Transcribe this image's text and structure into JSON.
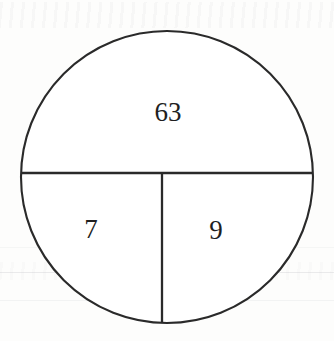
{
  "figure": {
    "kind": "divided-circle-diagram",
    "background_color": "#fdfdfc",
    "stroke_color": "#2a2a2a",
    "label_color": "#1f1f1f",
    "circle": {
      "center_x": 167,
      "center_y": 177,
      "radius": 146
    },
    "dividers": [
      {
        "name": "horizontal-diameter",
        "orientation": "horizontal",
        "y": 173,
        "x_start": 22,
        "x_end": 313
      },
      {
        "name": "vertical-radius",
        "orientation": "vertical",
        "x": 162,
        "y_start": 173,
        "y_end": 323
      }
    ],
    "regions": [
      {
        "name": "top-half",
        "label": "63",
        "label_x": 168,
        "label_y": 112
      },
      {
        "name": "bottom-left-quarter",
        "label": "7",
        "label_x": 91,
        "label_y": 229
      },
      {
        "name": "bottom-right-quarter",
        "label": "9",
        "label_x": 216,
        "label_y": 230
      }
    ]
  },
  "chart_data": {
    "type": "pie",
    "title": "",
    "subtitle": "",
    "xlabel": "",
    "ylabel": "",
    "legend_position": "none",
    "grid": false,
    "labels": [
      "63",
      "7",
      "9"
    ],
    "categories": [
      "top half",
      "bottom left quarter",
      "bottom right quarter"
    ],
    "values": [
      63,
      7,
      9
    ],
    "slice_fractions": [
      0.5,
      0.25,
      0.25
    ],
    "slice_degrees": [
      180,
      90,
      90
    ],
    "annotations": [
      {
        "text": "63",
        "region": "top half"
      },
      {
        "text": "7",
        "region": "bottom left quarter"
      },
      {
        "text": "9",
        "region": "bottom right quarter"
      }
    ]
  }
}
